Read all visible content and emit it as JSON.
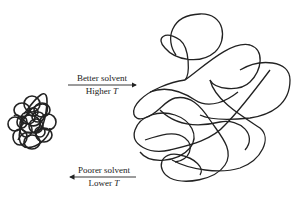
{
  "diagram": {
    "forward_arrow": {
      "top_label": "Better solvent",
      "bottom_label_prefix": "Higher ",
      "bottom_label_var": "T",
      "direction": "right"
    },
    "reverse_arrow": {
      "top_label": "Poorer solvent",
      "bottom_label_prefix": "Lower ",
      "bottom_label_var": "T",
      "direction": "left"
    },
    "compact_coil": {
      "description": "collapsed polymer coil"
    },
    "expanded_coil": {
      "description": "expanded polymer coil"
    },
    "colors": {
      "ink": "#222222",
      "background": "#ffffff"
    }
  }
}
